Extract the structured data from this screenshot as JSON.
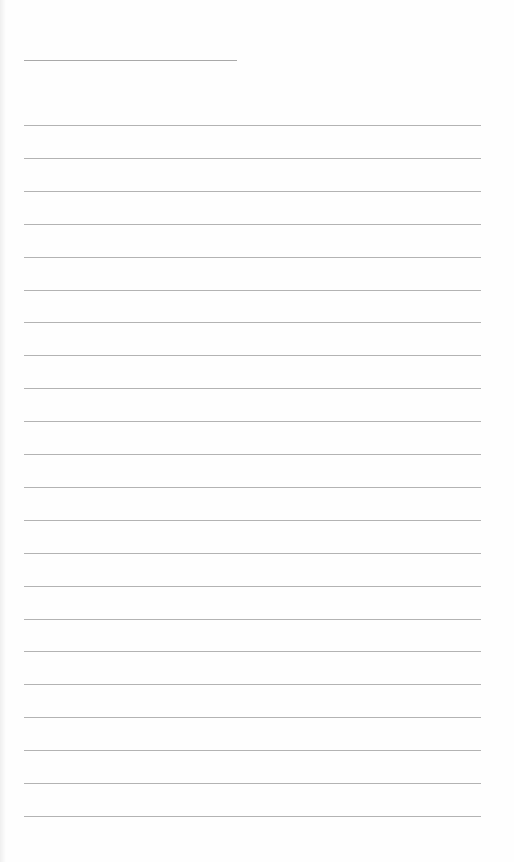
{
  "document": {
    "type": "lined-notepaper",
    "title_line": {
      "x": 24,
      "y": 60,
      "width": 213,
      "color": "#a9a9a9"
    },
    "ruled_lines": {
      "count": 22,
      "first_y": 125,
      "spacing": 32.9,
      "x": 24,
      "width": 457,
      "color": "#b3b3b3"
    },
    "background_color": "#fefefe"
  }
}
